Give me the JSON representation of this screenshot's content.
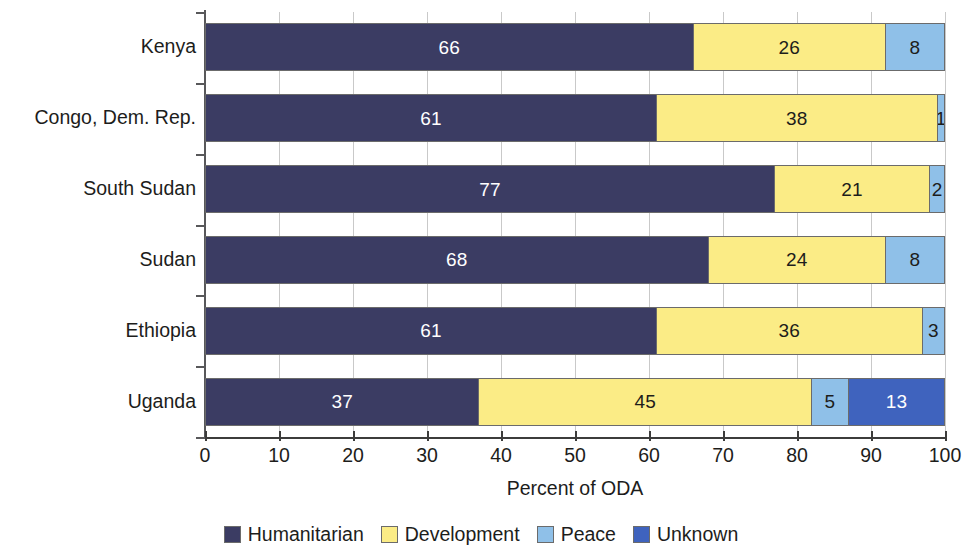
{
  "chart_data": {
    "type": "bar",
    "orientation": "horizontal",
    "stacked": true,
    "title": "",
    "xlabel": "Percent of ODA",
    "ylabel": "",
    "xlim": [
      0,
      100
    ],
    "xticks": [
      0,
      10,
      20,
      30,
      40,
      50,
      60,
      70,
      80,
      90,
      100
    ],
    "xtick_labels": [
      "0",
      "10",
      "20",
      "30",
      "40",
      "50",
      "60",
      "70",
      "80",
      "90",
      "100"
    ],
    "grid": "vertical",
    "legend_position": "bottom",
    "categories": [
      "Kenya",
      "Congo, Dem. Rep.",
      "South Sudan",
      "Sudan",
      "Ethiopia",
      "Uganda"
    ],
    "series": [
      {
        "name": "Humanitarian",
        "color": "#3b3c63",
        "values": [
          66,
          61,
          77,
          68,
          61,
          37
        ]
      },
      {
        "name": "Development",
        "color": "#fbec86",
        "values": [
          26,
          38,
          21,
          24,
          36,
          45
        ]
      },
      {
        "name": "Peace",
        "color": "#8fc0e8",
        "values": [
          8,
          1,
          2,
          8,
          3,
          5
        ]
      },
      {
        "name": "Unknown",
        "color": "#3f63be",
        "values": [
          0,
          0,
          0,
          0,
          0,
          13
        ]
      }
    ]
  },
  "axis": {
    "x_title": "Percent of ODA"
  },
  "legend": {
    "items": [
      {
        "label": "Humanitarian",
        "color": "#3b3c63",
        "swatch_icon": "square-swatch-icon"
      },
      {
        "label": "Development",
        "color": "#fbec86",
        "swatch_icon": "square-swatch-icon"
      },
      {
        "label": "Peace",
        "color": "#8fc0e8",
        "swatch_icon": "square-swatch-icon"
      },
      {
        "label": "Unknown",
        "color": "#3f63be",
        "swatch_icon": "square-swatch-icon"
      }
    ]
  },
  "colors": {
    "humanitarian": "#3b3c63",
    "development": "#fbec86",
    "peace": "#8fc0e8",
    "unknown": "#3f63be",
    "gridline": "#c9c9c9",
    "axis": "#3c3c3b",
    "text": "#1d1d1b",
    "background": "#ffffff"
  }
}
